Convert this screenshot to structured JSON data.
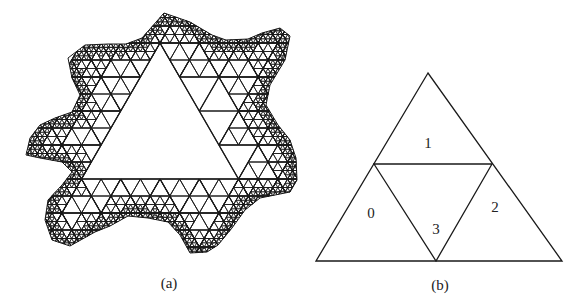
{
  "figure_a": {
    "caption": "(a)",
    "caption_pos": [
      169,
      283
    ],
    "stroke_color": "#1a1a1a",
    "lattice": {
      "apex": [
        160,
        43
      ],
      "row_height": 34,
      "side": 39.26,
      "central_triangle_rows": 4
    },
    "outline": [
      [
        164,
        13
      ],
      [
        190,
        22
      ],
      [
        212,
        35
      ],
      [
        226,
        40
      ],
      [
        248,
        39
      ],
      [
        262,
        33
      ],
      [
        280,
        28
      ],
      [
        290,
        36
      ],
      [
        285,
        60
      ],
      [
        270,
        85
      ],
      [
        266,
        105
      ],
      [
        278,
        125
      ],
      [
        290,
        140
      ],
      [
        296,
        158
      ],
      [
        297,
        180
      ],
      [
        290,
        192
      ],
      [
        260,
        198
      ],
      [
        245,
        210
      ],
      [
        232,
        228
      ],
      [
        218,
        245
      ],
      [
        207,
        252
      ],
      [
        190,
        253
      ],
      [
        180,
        235
      ],
      [
        168,
        222
      ],
      [
        148,
        218
      ],
      [
        128,
        216
      ],
      [
        110,
        226
      ],
      [
        95,
        232
      ],
      [
        70,
        246
      ],
      [
        52,
        240
      ],
      [
        45,
        220
      ],
      [
        48,
        200
      ],
      [
        62,
        185
      ],
      [
        72,
        172
      ],
      [
        62,
        162
      ],
      [
        40,
        158
      ],
      [
        26,
        155
      ],
      [
        30,
        138
      ],
      [
        40,
        125
      ],
      [
        55,
        118
      ],
      [
        72,
        112
      ],
      [
        80,
        95
      ],
      [
        72,
        78
      ],
      [
        68,
        58
      ],
      [
        85,
        45
      ],
      [
        108,
        44
      ],
      [
        126,
        44
      ],
      [
        142,
        38
      ]
    ]
  },
  "figure_b": {
    "caption": "(b)",
    "caption_pos": [
      440,
      285
    ],
    "stroke_color": "#1a1a1a",
    "outer_triangle": [
      [
        428,
        73
      ],
      [
        316,
        261
      ],
      [
        562,
        261
      ]
    ],
    "mid_left": [
      374,
      164
    ],
    "mid_right": [
      492,
      164
    ],
    "mid_bottom": [
      436,
      261
    ],
    "regions": [
      {
        "label": "0",
        "pos": [
          371,
          213
        ]
      },
      {
        "label": "1",
        "pos": [
          428,
          143
        ]
      },
      {
        "label": "2",
        "pos": [
          495,
          207
        ]
      },
      {
        "label": "3",
        "pos": [
          436,
          229
        ]
      }
    ]
  }
}
